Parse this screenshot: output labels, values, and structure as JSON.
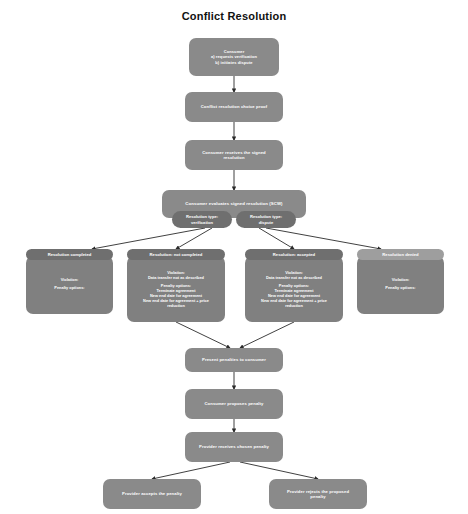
{
  "title": "Conflict Resolution",
  "theme": {
    "node_fill": "#8a8a8a",
    "node_fill_dark": "#6f6f6f",
    "node_fill_light": "#9e9e9e",
    "edge_color": "#2b2b2b",
    "text_color": "#ffffff",
    "background": "#ffffff",
    "title_color": "#111111"
  },
  "diagram": {
    "type": "flowchart",
    "direction": "top-down",
    "nodes": [
      {
        "id": "consumer-start",
        "lines": [
          "Consumer",
          "a) requests verification",
          "b) initiates dispute"
        ],
        "shape": "rounded-rect"
      },
      {
        "id": "conflict-proof",
        "lines": [
          "Conflict resolution choice proof"
        ],
        "shape": "rounded-rect"
      },
      {
        "id": "consumer-receives",
        "lines": [
          "Consumer receives the signed",
          "resolution"
        ],
        "shape": "rounded-rect"
      },
      {
        "id": "consumer-evaluates",
        "lines": [
          "Consumer evaluates signed resolution (SCW)"
        ],
        "shape": "rounded-rect"
      },
      {
        "id": "present-penalties",
        "lines": [
          "Present penalties to consumer"
        ],
        "shape": "rounded-rect"
      },
      {
        "id": "consumer-proposes",
        "lines": [
          "Consumer proposes penalty"
        ],
        "shape": "rounded-rect"
      },
      {
        "id": "provider-receives",
        "lines": [
          "Provider receives chosen penalty"
        ],
        "shape": "rounded-rect"
      },
      {
        "id": "provider-accepts",
        "lines": [
          "Provider accepts the penalty"
        ],
        "shape": "rounded-rect"
      },
      {
        "id": "provider-rejects",
        "lines": [
          "Provider rejects the proposed",
          "penalty"
        ],
        "shape": "rounded-rect"
      }
    ],
    "decision_chips": [
      {
        "id": "chip-verification",
        "lines": [
          "Resolution type:",
          "verification"
        ]
      },
      {
        "id": "chip-dispute",
        "lines": [
          "Resolution type:",
          "dispute"
        ]
      }
    ],
    "branches": [
      {
        "id": "branch-resolution-completed",
        "header": "Resolution completed",
        "from_chip": "chip-verification",
        "body_lines": [
          "Violation:",
          "",
          "Penalty options:",
          ""
        ]
      },
      {
        "id": "branch-resolution-not-completed",
        "header": "Resolution: not completed",
        "from_chip": "chip-verification",
        "body_lines": [
          "Violation:",
          "Data transfer not as described",
          "",
          "Penalty options:",
          "Terminate agreement",
          "New end date for agreement",
          "New end date for agreement + price",
          "reduction"
        ]
      },
      {
        "id": "branch-resolution-accepted",
        "header": "Resolution: accepted",
        "from_chip": "chip-dispute",
        "body_lines": [
          "Violation:",
          "Data transfer not as described",
          "",
          "Penalty options:",
          "Terminate agreement",
          "New end date for agreement",
          "New end date for agreement + price",
          "reduction"
        ]
      },
      {
        "id": "branch-resolution-denied",
        "header": "Resolution denied",
        "from_chip": "chip-dispute",
        "body_lines": [
          "Violation:",
          "",
          "Penalty options:",
          ""
        ]
      }
    ]
  }
}
